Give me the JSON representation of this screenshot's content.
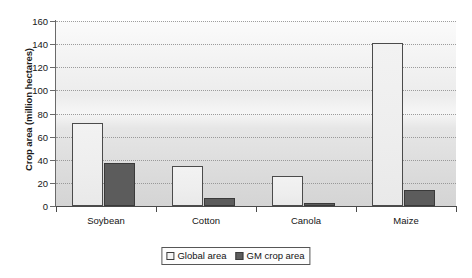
{
  "chart_data": {
    "type": "bar",
    "title": "",
    "xlabel": "",
    "ylabel": "Crop area (million hectares)",
    "categories": [
      "Soybean",
      "Cotton",
      "Canola",
      "Maize"
    ],
    "series": [
      {
        "name": "Global area",
        "values": [
          72,
          35,
          26,
          141
        ],
        "color": "#f0f0f0"
      },
      {
        "name": "GM crop area",
        "values": [
          37,
          7,
          3,
          14
        ],
        "color": "#5c5c5c"
      }
    ],
    "ylim": [
      0,
      160
    ],
    "ytick_step": 20,
    "yticks": [
      0,
      20,
      40,
      60,
      80,
      100,
      120,
      140,
      160
    ],
    "ytick_labels": [
      "0",
      "20",
      "40",
      "60",
      "80",
      "100",
      "120",
      "140",
      "160"
    ],
    "grid": "horizontal-dotted",
    "legend_position": "bottom-center"
  },
  "legend": {
    "entries": [
      {
        "label": "Global area",
        "swatch": "global-area-swatch"
      },
      {
        "label": "GM crop area",
        "swatch": "gm-crop-area-swatch"
      }
    ]
  }
}
